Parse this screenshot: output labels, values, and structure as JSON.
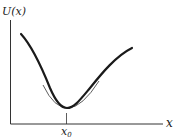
{
  "diagram": {
    "type": "potential-energy-curve",
    "y_axis_label": "U(x)",
    "x_axis_label": "x",
    "minimum_label": "x",
    "minimum_subscript": "0",
    "elements": [
      "potential energy curve U(x) with a single minimum",
      "parabolic (harmonic) approximation near minimum at x0",
      "tick mark at x0 on x-axis"
    ],
    "colors": {
      "curve": "#1a1a1a",
      "approximation": "#333333",
      "axes": "#333333",
      "background": "#ffffff"
    }
  }
}
